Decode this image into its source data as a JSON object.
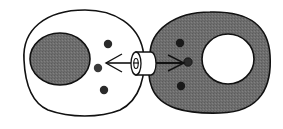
{
  "diagram": {
    "colors": {
      "background": "#ffffff",
      "outline": "#111111",
      "cytoplasm_gray": "#6e6e6e",
      "molecule": "#222222"
    },
    "left_cell": {
      "cytoplasm": "white",
      "nucleus": "gray",
      "molecules": 3
    },
    "right_cell": {
      "cytoplasm": "gray",
      "nucleus": "white",
      "molecules": 3
    },
    "channel": {
      "shape": "cylinder",
      "arrows": [
        "left",
        "right"
      ]
    }
  }
}
